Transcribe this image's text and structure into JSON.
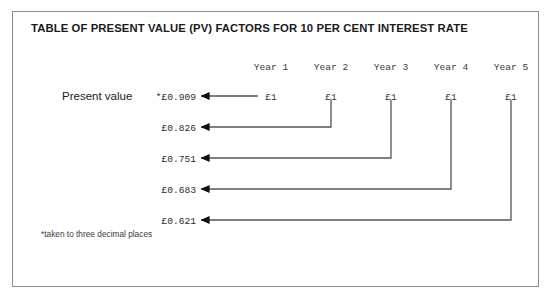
{
  "figure": {
    "title": "TABLE OF PRESENT VALUE (PV) FACTORS FOR 10 PER CENT INTEREST RATE",
    "row_label": "Present value",
    "footnote": "*taken to three decimal places",
    "border_color": "#8d8d8d",
    "line_color": "#555555",
    "arrow_color": "#111111",
    "text_color": "#1b1b1b"
  },
  "chart_data": {
    "type": "table",
    "title": "TABLE OF PRESENT VALUE (PV) FACTORS FOR 10 PER CENT INTEREST RATE",
    "xlabel": "",
    "ylabel": "",
    "interest_rate_percent": 10,
    "columns": [
      "Year 1",
      "Year 2",
      "Year 3",
      "Year 4",
      "Year 5"
    ],
    "row_label": "Present value",
    "cash_flows": [
      "£1",
      "£1",
      "£1",
      "£1",
      "£1"
    ],
    "pv_factors": [
      "*£0.909",
      "£0.826",
      "£0.751",
      "£0.683",
      "£0.621"
    ],
    "pv_values": [
      0.909,
      0.826,
      0.751,
      0.683,
      0.621
    ],
    "note": "*taken to three decimal places",
    "legend": [],
    "grid": false
  },
  "columns": [
    {
      "header": "Year 1",
      "cash": "£1",
      "pv": "*£0.909",
      "x": 271,
      "drop_to_row": 0
    },
    {
      "header": "Year 2",
      "cash": "£1",
      "pv": "£0.826",
      "x": 331,
      "drop_to_row": 1
    },
    {
      "header": "Year 3",
      "cash": "£1",
      "pv": "£0.751",
      "x": 391,
      "drop_to_row": 2
    },
    {
      "header": "Year 4",
      "cash": "£1",
      "pv": "£0.683",
      "x": 451,
      "drop_to_row": 3
    },
    {
      "header": "Year 5",
      "cash": "£1",
      "pv": "£0.621",
      "x": 511,
      "drop_to_row": 4
    }
  ],
  "rows": [
    {
      "pv": "*£0.909",
      "y": 96
    },
    {
      "pv": "£0.826",
      "y": 127
    },
    {
      "pv": "£0.751",
      "y": 158
    },
    {
      "pv": "£0.683",
      "y": 189
    },
    {
      "pv": "£0.621",
      "y": 220
    }
  ]
}
